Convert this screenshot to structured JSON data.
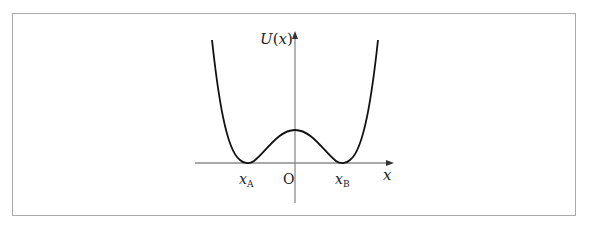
{
  "figure": {
    "type": "potential-energy-curve",
    "y_axis_label": {
      "main": "U",
      "paren_open": "(",
      "var": "x",
      "paren_close": ")"
    },
    "x_axis_label": "x",
    "origin_label": "O",
    "points": [
      {
        "id": "xA",
        "main": "x",
        "sub": "A"
      },
      {
        "id": "xB",
        "main": "x",
        "sub": "B"
      }
    ],
    "colors": {
      "curve": "#111111",
      "axis": "#8c8c8c",
      "frame": "#a9a9a9"
    }
  }
}
